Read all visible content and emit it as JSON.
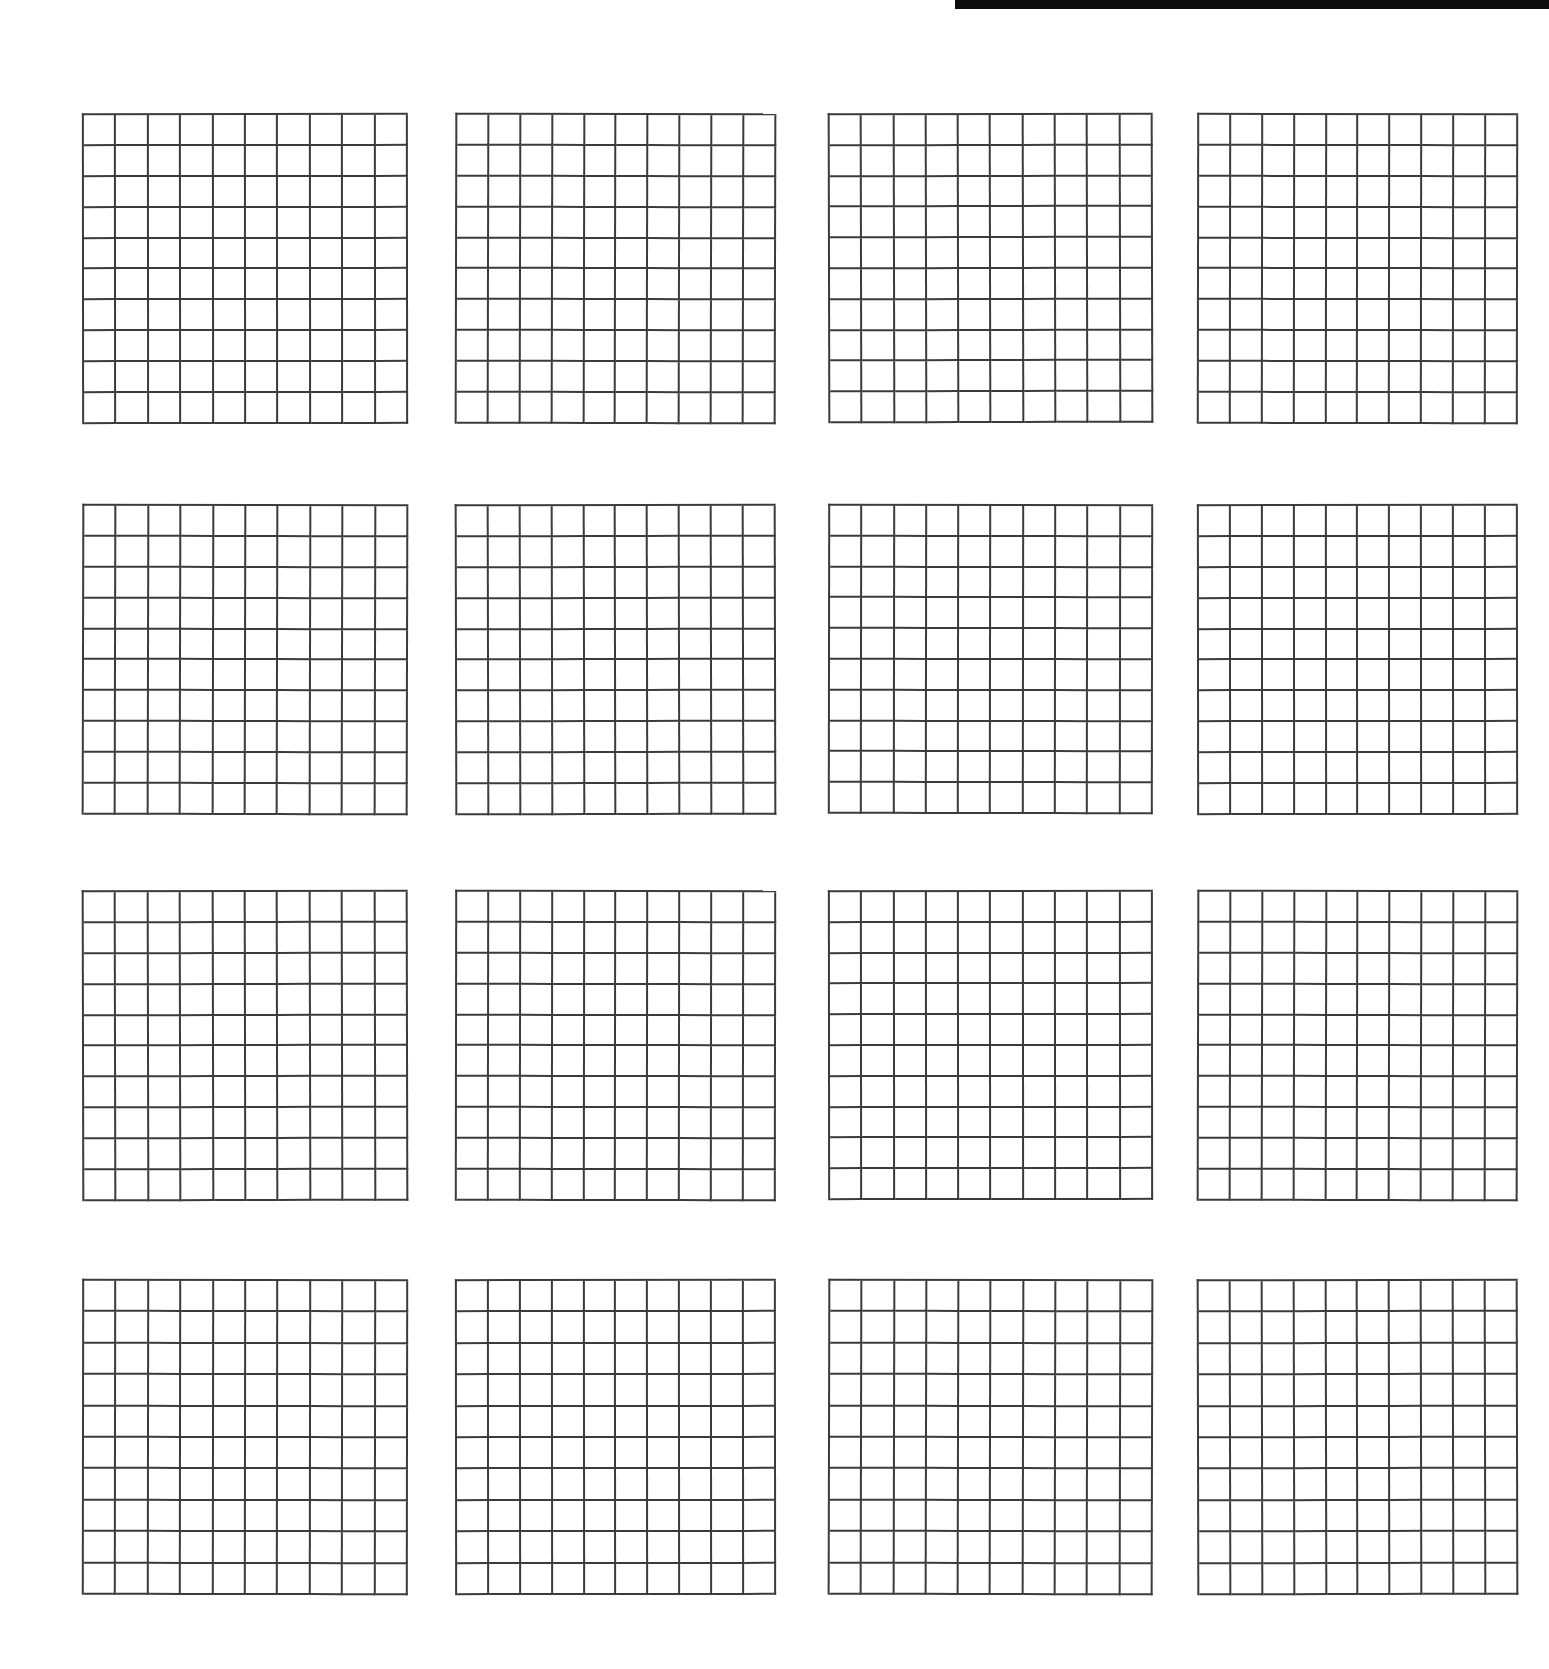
{
  "page": {
    "background_color": "#ffffff",
    "width": 1549,
    "height": 1669
  },
  "artifacts": [
    {
      "name": "scan-edge-bar",
      "description": "thick black scan edge bar at top right",
      "color": "#0d0d0d",
      "x": 955,
      "y": 0,
      "width": 594,
      "height": 9
    }
  ],
  "grid_style": {
    "line_color": "#3b3b3b",
    "line_width_px": 2,
    "fill_color": "#ffffff",
    "rows_per_grid": 10,
    "cols_per_grid": 10,
    "cells_per_grid": 100
  },
  "layout": {
    "grid_rows": 4,
    "grid_cols": 4,
    "total_grids": 16,
    "column_x": [
      82,
      455,
      828,
      1197
    ],
    "row_y": [
      113,
      504,
      890,
      1279
    ],
    "grid_width": [
      326,
      321,
      325,
      321
    ],
    "grid_height": [
      311,
      311,
      310,
      316
    ]
  },
  "grids": [
    {
      "id": "grid-1",
      "row": 1,
      "col": 1,
      "rows": 10,
      "cols": 10,
      "filled": 0,
      "x": 82,
      "y": 113,
      "width": 326,
      "height": 311
    },
    {
      "id": "grid-2",
      "row": 1,
      "col": 2,
      "rows": 10,
      "cols": 10,
      "filled": 0,
      "x": 455,
      "y": 113,
      "width": 321,
      "height": 311
    },
    {
      "id": "grid-3",
      "row": 1,
      "col": 3,
      "rows": 10,
      "cols": 10,
      "filled": 0,
      "x": 828,
      "y": 113,
      "width": 325,
      "height": 310
    },
    {
      "id": "grid-4",
      "row": 1,
      "col": 4,
      "rows": 10,
      "cols": 10,
      "filled": 0,
      "x": 1197,
      "y": 113,
      "width": 321,
      "height": 311
    },
    {
      "id": "grid-5",
      "row": 2,
      "col": 1,
      "rows": 10,
      "cols": 10,
      "filled": 0,
      "x": 82,
      "y": 504,
      "width": 326,
      "height": 311
    },
    {
      "id": "grid-6",
      "row": 2,
      "col": 2,
      "rows": 10,
      "cols": 10,
      "filled": 0,
      "x": 455,
      "y": 504,
      "width": 321,
      "height": 311
    },
    {
      "id": "grid-7",
      "row": 2,
      "col": 3,
      "rows": 10,
      "cols": 10,
      "filled": 0,
      "x": 828,
      "y": 504,
      "width": 325,
      "height": 310
    },
    {
      "id": "grid-8",
      "row": 2,
      "col": 4,
      "rows": 10,
      "cols": 10,
      "filled": 0,
      "x": 1197,
      "y": 504,
      "width": 321,
      "height": 311
    },
    {
      "id": "grid-9",
      "row": 3,
      "col": 1,
      "rows": 10,
      "cols": 10,
      "filled": 0,
      "x": 82,
      "y": 890,
      "width": 326,
      "height": 311
    },
    {
      "id": "grid-10",
      "row": 3,
      "col": 2,
      "rows": 10,
      "cols": 10,
      "filled": 0,
      "x": 455,
      "y": 890,
      "width": 321,
      "height": 311
    },
    {
      "id": "grid-11",
      "row": 3,
      "col": 3,
      "rows": 10,
      "cols": 10,
      "filled": 0,
      "x": 828,
      "y": 890,
      "width": 325,
      "height": 310
    },
    {
      "id": "grid-12",
      "row": 3,
      "col": 4,
      "rows": 10,
      "cols": 10,
      "filled": 0,
      "x": 1197,
      "y": 890,
      "width": 321,
      "height": 311
    },
    {
      "id": "grid-13",
      "row": 4,
      "col": 1,
      "rows": 10,
      "cols": 10,
      "filled": 0,
      "x": 82,
      "y": 1279,
      "width": 326,
      "height": 316
    },
    {
      "id": "grid-14",
      "row": 4,
      "col": 2,
      "rows": 10,
      "cols": 10,
      "filled": 0,
      "x": 455,
      "y": 1279,
      "width": 321,
      "height": 316
    },
    {
      "id": "grid-15",
      "row": 4,
      "col": 3,
      "rows": 10,
      "cols": 10,
      "filled": 0,
      "x": 828,
      "y": 1279,
      "width": 325,
      "height": 316
    },
    {
      "id": "grid-16",
      "row": 4,
      "col": 4,
      "rows": 10,
      "cols": 10,
      "filled": 0,
      "x": 1197,
      "y": 1279,
      "width": 321,
      "height": 316
    }
  ]
}
